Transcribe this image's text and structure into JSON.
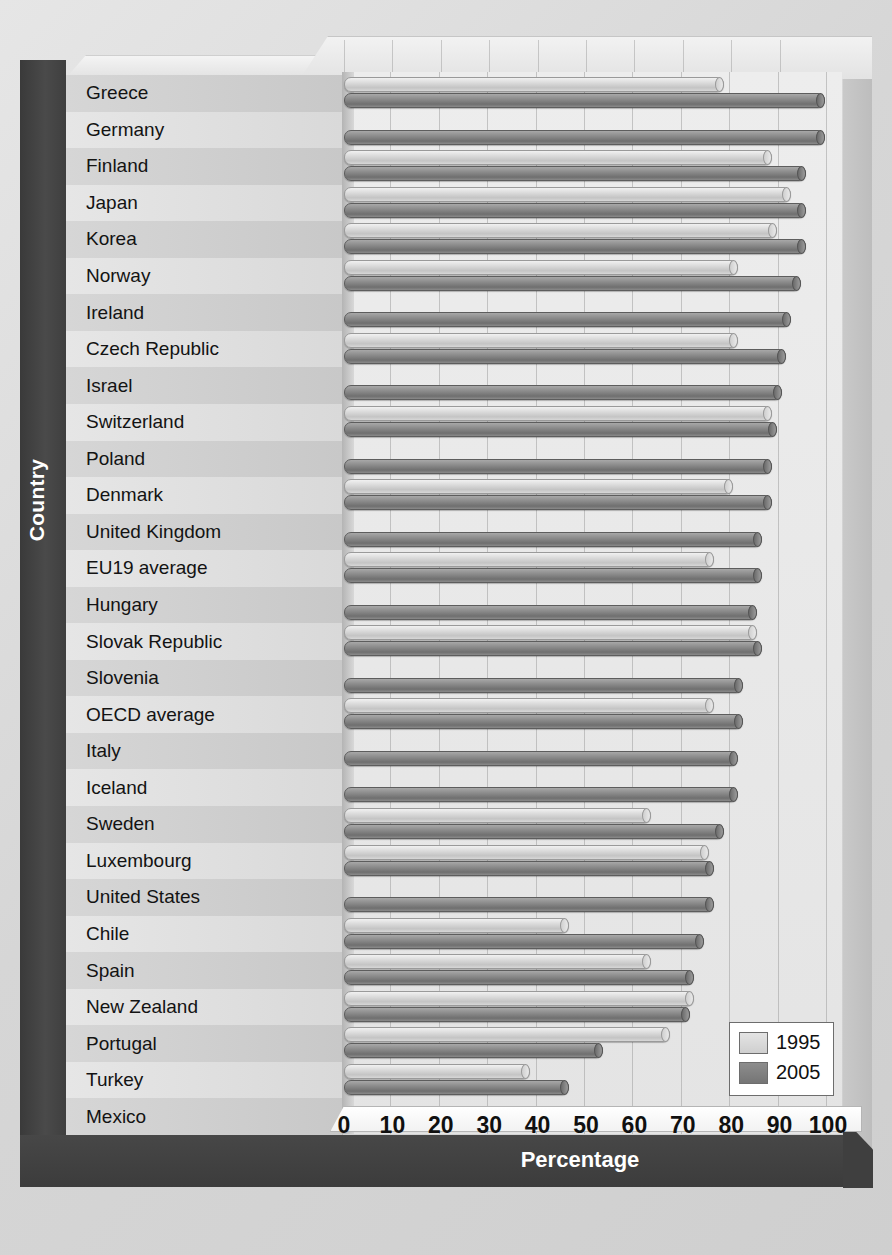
{
  "chart_data": {
    "type": "bar",
    "orientation": "horizontal",
    "title": "",
    "xlabel": "Percentage",
    "ylabel": "Country",
    "xlim": [
      0,
      100
    ],
    "xticks": [
      0,
      10,
      20,
      30,
      40,
      50,
      60,
      70,
      80,
      90,
      100
    ],
    "grid": true,
    "legend_position": "bottom-right",
    "categories": [
      "Greece",
      "Germany",
      "Finland",
      "Japan",
      "Korea",
      "Norway",
      "Ireland",
      "Czech Republic",
      "Israel",
      "Switzerland",
      "Poland",
      "Denmark",
      "United Kingdom",
      "EU19 average",
      "Hungary",
      "Slovak Republic",
      "Slovenia",
      "OECD average",
      "Italy",
      "Iceland",
      "Sweden",
      "Luxembourg",
      "United States",
      "Chile",
      "Spain",
      "New Zealand",
      "Portugal",
      "Turkey",
      "Mexico"
    ],
    "series": [
      {
        "name": "1995",
        "color": "#d8d8d8",
        "values": [
          78,
          0,
          88,
          92,
          89,
          81,
          0,
          81,
          0,
          88,
          0,
          80,
          0,
          76,
          0,
          85,
          0,
          76,
          0,
          0,
          63,
          75,
          0,
          46,
          63,
          72,
          67,
          38,
          0
        ]
      },
      {
        "name": "2005",
        "color": "#7d7d7d",
        "values": [
          99,
          99,
          95,
          95,
          95,
          94,
          92,
          91,
          90,
          89,
          88,
          88,
          86,
          86,
          85,
          86,
          82,
          82,
          81,
          81,
          78,
          76,
          76,
          74,
          72,
          71,
          53,
          46,
          40
        ]
      }
    ]
  },
  "legend": {
    "items": [
      {
        "label": "1995"
      },
      {
        "label": "2005"
      }
    ]
  },
  "axes": {
    "x_title": "Percentage",
    "y_title": "Country"
  }
}
